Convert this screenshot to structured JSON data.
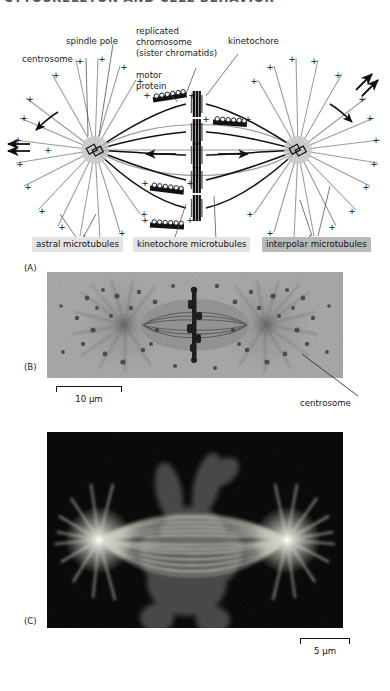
{
  "running_head": "CYTOSKELETON AND CELL BEHAVIOR",
  "panel_a": {
    "letter": "(A)",
    "labels": {
      "spindle_pole": "spindle pole",
      "centrosome": "centrosome",
      "replicated_chromosome": "replicated chromosome (sister chromatids)",
      "replicated_chromosome_l1": "replicated",
      "replicated_chromosome_l2": "chromosome",
      "replicated_chromosome_l3": "(sister chromatids)",
      "kinetochore": "kinetochore",
      "motor_protein_l1": "motor",
      "motor_protein_l2": "protein",
      "plus_sign": "+"
    },
    "chips": [
      {
        "label": "astral microtubules",
        "shade": "light"
      },
      {
        "label": "kinetochore microtubules",
        "shade": "light"
      },
      {
        "label": "interpolar microtubules",
        "shade": "dark"
      }
    ]
  },
  "panel_b": {
    "letter": "(B)",
    "scale_label": "10 µm",
    "callout": "centrosome",
    "caption_type": "phase-contrast micrograph of mitotic spindle"
  },
  "panel_c": {
    "letter": "(C)",
    "scale_label": "5 µm",
    "caption_type": "fluorescence micrograph of mitotic spindle"
  },
  "colors": {
    "chip_light": "#e3e3e3",
    "chip_dark": "#b9b9b9",
    "ink": "#1a1a1a",
    "micrograph_bg": "#9a9a9a",
    "fluor_bg": "#050505",
    "fluor_fiber": "#d8d8d0"
  }
}
